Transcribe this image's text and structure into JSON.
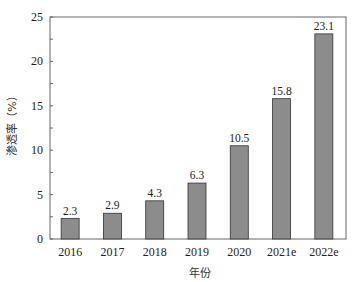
{
  "chart_data": {
    "type": "bar",
    "title": "",
    "xlabel": "年份",
    "ylabel": "渗透率（%）",
    "categories": [
      "2016",
      "2017",
      "2018",
      "2019",
      "2020",
      "2021e",
      "2022e"
    ],
    "values": [
      2.3,
      2.9,
      4.3,
      6.3,
      10.5,
      15.8,
      23.1
    ],
    "data_labels": [
      "2.3",
      "2.9",
      "4.3",
      "6.3",
      "10.5",
      "15.8",
      "23.1"
    ],
    "ylim": [
      0,
      25
    ],
    "yticks": [
      0,
      5,
      10,
      15,
      20,
      25
    ],
    "minor_ytick_step": 2.5,
    "grid": false,
    "legend": null,
    "bar_color": "#8c8c8c",
    "bar_edge_color": "#333333",
    "frame": "box"
  }
}
